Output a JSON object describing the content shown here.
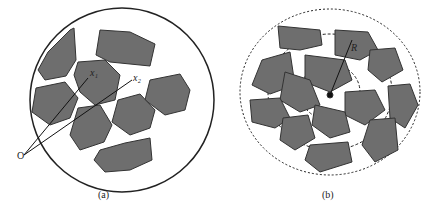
{
  "panel_a": {
    "caption": "(a)",
    "origin_label": "O",
    "vector1_label": "x₁",
    "vector2_label": "x₂"
  },
  "panel_b": {
    "caption": "(b)",
    "radius_label": "R"
  },
  "colors": {
    "particle": "#6e6e6e",
    "outline": "#222222"
  }
}
